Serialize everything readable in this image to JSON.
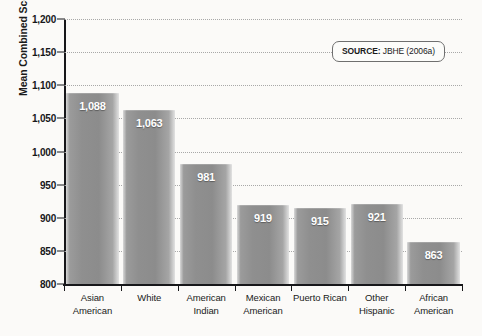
{
  "chart_data": {
    "type": "bar",
    "title": "",
    "xlabel": "",
    "ylabel": "Mean Combined Score",
    "ylim": [
      800,
      1200
    ],
    "ytick_values": [
      1200,
      1150,
      1100,
      1050,
      1000,
      950,
      900,
      850,
      800
    ],
    "ytick_labels": [
      "1,200",
      "1,150",
      "1,100",
      "1,050",
      "1,000",
      "950",
      "900",
      "850",
      "800"
    ],
    "grid": true,
    "legend": "none",
    "categories": [
      "Asian American",
      "White",
      "American Indian",
      "Mexican American",
      "Puerto Rican",
      "Other Hispanic",
      "African American"
    ],
    "category_lines": [
      [
        "Asian",
        "American"
      ],
      [
        "White",
        ""
      ],
      [
        "American",
        "Indian"
      ],
      [
        "Mexican",
        "American"
      ],
      [
        "Puerto Rican",
        ""
      ],
      [
        "Other",
        "Hispanic"
      ],
      [
        "African",
        "American"
      ]
    ],
    "values": [
      1088,
      1063,
      981,
      919,
      915,
      921,
      863
    ],
    "value_labels": [
      "1,088",
      "1,063",
      "981",
      "919",
      "915",
      "921",
      "863"
    ],
    "bar_color": "#8f8f8f",
    "grid_color": "#a8a8a8",
    "axis_color": "#17171a"
  },
  "source": {
    "label": "SOURCE:",
    "text": " JBHE (2006a)"
  }
}
